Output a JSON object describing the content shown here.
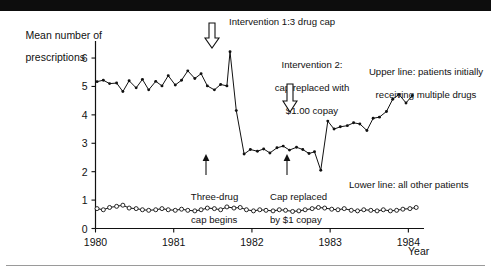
{
  "figure": {
    "axis": {
      "y_title_line1": "Mean number of",
      "y_title_line2": "prescriptions",
      "x_title": "Year",
      "y_ticks": [
        "0",
        "1",
        "2",
        "3",
        "4",
        "5",
        "6"
      ],
      "x_ticks": [
        "1980",
        "1981",
        "1982",
        "1983",
        "1984"
      ]
    },
    "annotations": {
      "intervention1": "Intervention 1:3 drug cap",
      "intervention2_l1": "Intervention 2:",
      "intervention2_l2": "cap replaced with",
      "intervention2_l3": "$1.00 copay",
      "upper_legend_l1": "Upper line: patients initially",
      "upper_legend_l2": "receiving multiple drugs",
      "lower_legend": "Lower line: all other patients",
      "marker1_l1": "Three-drug",
      "marker1_l2": "cap begins",
      "marker2_l1": "Cap replaced",
      "marker2_l2": "by $1 copay"
    }
  },
  "chart_data": {
    "type": "line",
    "title": "",
    "xlabel": "Year",
    "ylabel": "Mean number of prescriptions",
    "xlim": [
      1980.0,
      1984.2
    ],
    "ylim": [
      0,
      6.6
    ],
    "grid": false,
    "legend_position": "inline-annotations",
    "interventions": [
      {
        "label": "Intervention 1: 3 drug cap",
        "x": 1981.72,
        "short": "Three-drug cap begins"
      },
      {
        "label": "Intervention 2: cap replaced with $1.00 copay",
        "x": 1982.78,
        "short": "Cap replaced by $1 copay"
      }
    ],
    "series": [
      {
        "name": "Upper line: patients initially receiving multiple drugs",
        "marker": "filled-dot",
        "x": [
          1980.02,
          1980.1,
          1980.18,
          1980.27,
          1980.35,
          1980.43,
          1980.52,
          1980.6,
          1980.68,
          1980.77,
          1980.85,
          1980.93,
          1981.02,
          1981.1,
          1981.18,
          1981.27,
          1981.35,
          1981.43,
          1981.52,
          1981.6,
          1981.68,
          1981.72,
          1981.8,
          1981.9,
          1981.98,
          1982.07,
          1982.15,
          1982.23,
          1982.32,
          1982.4,
          1982.48,
          1982.57,
          1982.65,
          1982.73,
          1982.8,
          1982.88,
          1982.97,
          1983.05,
          1983.13,
          1983.22,
          1983.3,
          1983.38,
          1983.47,
          1983.55,
          1983.63,
          1983.72,
          1983.8,
          1983.88,
          1983.97,
          1984.05
        ],
        "y": [
          5.17,
          5.22,
          5.1,
          5.12,
          4.82,
          5.2,
          4.95,
          5.25,
          4.88,
          5.18,
          5.02,
          5.38,
          5.05,
          5.22,
          5.55,
          5.28,
          5.45,
          5.02,
          4.88,
          5.07,
          5.02,
          6.22,
          4.15,
          2.62,
          2.78,
          2.72,
          2.8,
          2.66,
          2.84,
          2.9,
          2.76,
          2.86,
          2.78,
          2.64,
          2.7,
          2.05,
          3.78,
          3.5,
          3.58,
          3.62,
          3.72,
          3.68,
          3.45,
          3.88,
          3.92,
          4.12,
          4.55,
          4.72,
          4.42,
          4.68
        ]
      },
      {
        "name": "Lower line: all other patients",
        "marker": "open-circle",
        "x": [
          1980.02,
          1980.1,
          1980.18,
          1980.27,
          1980.35,
          1980.43,
          1980.52,
          1980.6,
          1980.68,
          1980.77,
          1980.85,
          1980.93,
          1981.02,
          1981.1,
          1981.18,
          1981.27,
          1981.35,
          1981.43,
          1981.52,
          1981.6,
          1981.68,
          1981.77,
          1981.85,
          1981.93,
          1982.02,
          1982.1,
          1982.18,
          1982.27,
          1982.35,
          1982.43,
          1982.52,
          1982.6,
          1982.68,
          1982.77,
          1982.85,
          1982.93,
          1983.02,
          1983.1,
          1983.18,
          1983.27,
          1983.35,
          1983.43,
          1983.52,
          1983.6,
          1983.68,
          1983.77,
          1983.85,
          1983.93,
          1984.02,
          1984.1
        ],
        "y": [
          0.7,
          0.66,
          0.74,
          0.78,
          0.82,
          0.72,
          0.7,
          0.66,
          0.64,
          0.66,
          0.7,
          0.66,
          0.64,
          0.68,
          0.64,
          0.62,
          0.66,
          0.72,
          0.7,
          0.66,
          0.76,
          0.72,
          0.74,
          0.66,
          0.62,
          0.66,
          0.64,
          0.62,
          0.66,
          0.64,
          0.6,
          0.62,
          0.66,
          0.7,
          0.74,
          0.72,
          0.68,
          0.66,
          0.7,
          0.64,
          0.62,
          0.66,
          0.64,
          0.62,
          0.66,
          0.62,
          0.64,
          0.68,
          0.7,
          0.74
        ]
      }
    ]
  }
}
